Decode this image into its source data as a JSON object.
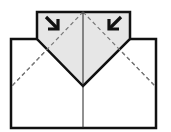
{
  "diagram": {
    "type": "origami-fold-step",
    "colors": {
      "paper": "#ffffff",
      "flap_fill": "#e6e6e6",
      "outline": "#111111",
      "valley_fold": "#777777",
      "arrow": "#111111"
    },
    "paper_rect": {
      "x": 11,
      "y": 39,
      "width": 145,
      "height": 89
    },
    "flap_polygon": "37,39 37,12 130,12 130,39 83,86",
    "center_crease": {
      "x1": 83,
      "y1": 12,
      "x2": 83,
      "y2": 128
    },
    "fold_lines": [
      {
        "name": "left-valley-fold",
        "x1": 83,
        "y1": 12,
        "x2": 11,
        "y2": 87
      },
      {
        "name": "right-valley-fold",
        "x1": 83,
        "y1": 12,
        "x2": 156,
        "y2": 87
      }
    ],
    "arrows": [
      {
        "name": "arrow-down-right",
        "direction": "down-right",
        "x": 48,
        "y": 19
      },
      {
        "name": "arrow-down-left",
        "direction": "down-left",
        "x": 118,
        "y": 19
      }
    ]
  }
}
